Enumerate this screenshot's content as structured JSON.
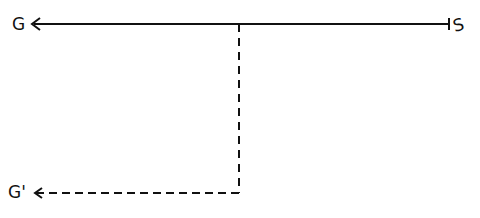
{
  "diagram": {
    "labels": {
      "goal": "G",
      "start": "S",
      "alt_goal": "G'"
    },
    "colors": {
      "stroke": "#111111",
      "background": "#ffffff"
    },
    "edges": [
      {
        "from": "S",
        "to": "G",
        "style": "solid",
        "arrow": "G"
      },
      {
        "from": "branch-point",
        "to": "G'",
        "style": "dashed",
        "arrow": "G'"
      }
    ]
  }
}
